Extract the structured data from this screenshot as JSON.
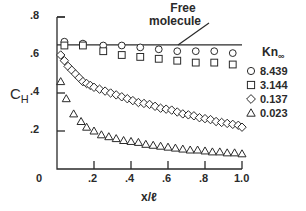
{
  "chart_data": {
    "type": "scatter",
    "title": "",
    "xlabel": "x/ℓ",
    "ylabel": "C_H",
    "xlim": [
      0,
      1.0
    ],
    "ylim": [
      0,
      0.8
    ],
    "x_ticks": [
      "0",
      ".2",
      ".4",
      ".6",
      ".8",
      "1.0"
    ],
    "y_ticks": [
      "0",
      ".2",
      ".4",
      ".6",
      ".8"
    ],
    "grid": false,
    "legend_title": "Kn∞",
    "legend_position": "right",
    "annotation": {
      "text_line1": "Free",
      "text_line2": "molecule",
      "value": 0.653
    },
    "series": [
      {
        "name": "8.439",
        "marker": "circle",
        "x": [
          0.04,
          0.14,
          0.25,
          0.35,
          0.45,
          0.55,
          0.65,
          0.75,
          0.85,
          0.95
        ],
        "y": [
          0.67,
          0.66,
          0.65,
          0.65,
          0.64,
          0.63,
          0.62,
          0.62,
          0.62,
          0.61
        ]
      },
      {
        "name": "3.144",
        "marker": "square",
        "x": [
          0.04,
          0.14,
          0.25,
          0.35,
          0.45,
          0.55,
          0.65,
          0.75,
          0.85,
          0.95
        ],
        "y": [
          0.65,
          0.65,
          0.62,
          0.6,
          0.59,
          0.58,
          0.57,
          0.56,
          0.56,
          0.55
        ]
      },
      {
        "name": "0.137",
        "marker": "diamond",
        "x": [
          0.02,
          0.04,
          0.06,
          0.08,
          0.1,
          0.12,
          0.14,
          0.16,
          0.18,
          0.2,
          0.23,
          0.26,
          0.29,
          0.32,
          0.35,
          0.38,
          0.41,
          0.44,
          0.47,
          0.5,
          0.53,
          0.56,
          0.59,
          0.62,
          0.65,
          0.68,
          0.71,
          0.74,
          0.77,
          0.8,
          0.83,
          0.86,
          0.89,
          0.92,
          0.95,
          0.98,
          1.0
        ],
        "y": [
          0.6,
          0.57,
          0.54,
          0.52,
          0.5,
          0.48,
          0.46,
          0.45,
          0.44,
          0.43,
          0.42,
          0.41,
          0.4,
          0.39,
          0.38,
          0.37,
          0.36,
          0.35,
          0.345,
          0.34,
          0.33,
          0.32,
          0.315,
          0.31,
          0.3,
          0.29,
          0.285,
          0.28,
          0.27,
          0.265,
          0.26,
          0.25,
          0.245,
          0.24,
          0.235,
          0.23,
          0.22
        ]
      },
      {
        "name": "0.023",
        "marker": "triangle",
        "x": [
          0.02,
          0.05,
          0.09,
          0.13,
          0.16,
          0.2,
          0.24,
          0.28,
          0.32,
          0.36,
          0.4,
          0.44,
          0.48,
          0.52,
          0.56,
          0.6,
          0.64,
          0.68,
          0.72,
          0.76,
          0.8,
          0.84,
          0.88,
          0.92,
          0.96,
          1.0
        ],
        "y": [
          0.46,
          0.37,
          0.29,
          0.25,
          0.22,
          0.2,
          0.18,
          0.17,
          0.16,
          0.15,
          0.145,
          0.14,
          0.13,
          0.125,
          0.12,
          0.115,
          0.11,
          0.105,
          0.1,
          0.1,
          0.095,
          0.09,
          0.09,
          0.085,
          0.085,
          0.08
        ]
      }
    ]
  },
  "legend": {
    "title_main": "Kn",
    "title_sub": "∞",
    "items": [
      {
        "label": "8.439",
        "marker": "circle"
      },
      {
        "label": "3.144",
        "marker": "square"
      },
      {
        "label": "0.137",
        "marker": "diamond"
      },
      {
        "label": "0.023",
        "marker": "triangle"
      }
    ]
  },
  "axes": {
    "ylabel_main": "C",
    "ylabel_sub": "H",
    "xlabel": "x/ℓ"
  },
  "colors": {
    "ink": "#2a2a2a",
    "background": "#ffffff"
  }
}
